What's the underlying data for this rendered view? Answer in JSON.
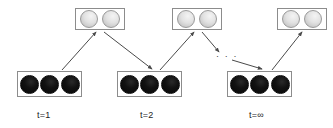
{
  "figure": {
    "type": "diagram",
    "subtype": "unrolled-recurrent-network-time-steps",
    "width": 333,
    "height": 128,
    "background_color": "#ffffff"
  },
  "palette": {
    "box_border": "#8c8c8c",
    "light_unit_fill": "#e2e2e2",
    "light_unit_border": "#9a9a9a",
    "dark_unit_fill": "#0d0d0d",
    "dark_unit_border": "#0b0b0b",
    "arrow_color": "#4a4a4a",
    "label_color": "#1a1a1a"
  },
  "layers": [
    {
      "id": "top-layer-1",
      "name": "hidden-layer-t1",
      "row": "top",
      "x": 75,
      "y": 8,
      "units": [
        {
          "name": "light-unit",
          "shade": "light"
        },
        {
          "name": "light-unit",
          "shade": "light"
        }
      ]
    },
    {
      "id": "top-layer-2",
      "name": "hidden-layer-t2",
      "row": "top",
      "x": 172,
      "y": 8,
      "units": [
        {
          "name": "light-unit",
          "shade": "light"
        },
        {
          "name": "light-unit",
          "shade": "light"
        }
      ]
    },
    {
      "id": "top-layer-inf",
      "name": "hidden-layer-tinf",
      "row": "top",
      "x": 277,
      "y": 8,
      "units": [
        {
          "name": "light-unit",
          "shade": "light"
        },
        {
          "name": "light-unit",
          "shade": "light"
        }
      ]
    },
    {
      "id": "bottom-layer-1",
      "name": "visible-layer-t1",
      "row": "bottom",
      "x": 17,
      "y": 71,
      "units": [
        {
          "name": "dark-unit",
          "shade": "dark"
        },
        {
          "name": "dark-unit",
          "shade": "dark"
        },
        {
          "name": "dark-unit",
          "shade": "dark"
        }
      ]
    },
    {
      "id": "bottom-layer-2",
      "name": "visible-layer-t2",
      "row": "bottom",
      "x": 117,
      "y": 71,
      "units": [
        {
          "name": "dark-unit",
          "shade": "dark"
        },
        {
          "name": "dark-unit",
          "shade": "dark"
        },
        {
          "name": "dark-unit",
          "shade": "dark"
        }
      ]
    },
    {
      "id": "bottom-layer-inf",
      "name": "visible-layer-tinf",
      "row": "bottom",
      "x": 227,
      "y": 71,
      "units": [
        {
          "name": "dark-unit",
          "shade": "dark"
        },
        {
          "name": "dark-unit",
          "shade": "dark"
        },
        {
          "name": "dark-unit",
          "shade": "dark"
        }
      ]
    }
  ],
  "edges": [
    {
      "name": "edge-visible1-to-hidden1",
      "x1": 62,
      "y1": 70,
      "x2": 96,
      "y2": 32
    },
    {
      "name": "edge-hidden1-to-visible2",
      "x1": 104,
      "y1": 32,
      "x2": 152,
      "y2": 69
    },
    {
      "name": "edge-visible2-to-hidden2",
      "x1": 160,
      "y1": 70,
      "x2": 194,
      "y2": 32
    },
    {
      "name": "edge-hidden2-to-gap",
      "x1": 202,
      "y1": 32,
      "x2": 219,
      "y2": 52
    },
    {
      "name": "edge-gap-to-visible-inf",
      "x1": 232,
      "y1": 60,
      "x2": 262,
      "y2": 69
    },
    {
      "name": "edge-visible-inf-to-hidden-inf",
      "x1": 272,
      "y1": 70,
      "x2": 302,
      "y2": 32
    }
  ],
  "ellipsis": {
    "name": "ellipsis-gap",
    "text": "· · ·",
    "x": 216,
    "y": 51
  },
  "time_labels": [
    {
      "name": "time-label-t1",
      "text": "t=1",
      "x": 37,
      "y": 110
    },
    {
      "name": "time-label-t2",
      "text": "t=2",
      "x": 140,
      "y": 110
    },
    {
      "name": "time-label-tinf",
      "text": "t=∞",
      "x": 249,
      "y": 110
    }
  ]
}
